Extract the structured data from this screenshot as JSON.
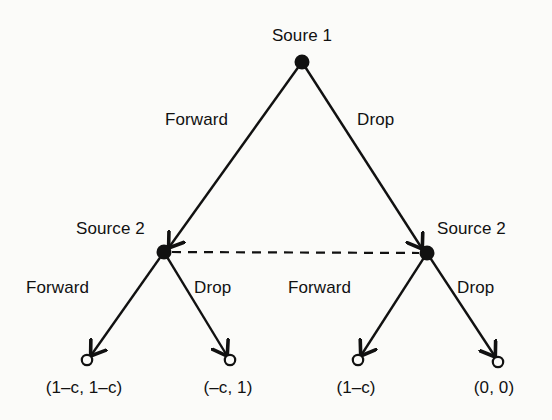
{
  "figure": {
    "type": "game-tree",
    "background_color": "#fbfbf9",
    "line_color": "#111111"
  },
  "nodes": {
    "root": {
      "label": "Soure 1",
      "marker": "filled-circle",
      "x": 302,
      "y": 62,
      "label_x": 302,
      "label_y": 26
    },
    "mid_left": {
      "label": "Source 2",
      "marker": "filled-circle",
      "x": 164,
      "y": 252,
      "label_x": 76,
      "label_y": 219
    },
    "mid_right": {
      "label": "Source 2",
      "marker": "filled-circle",
      "x": 427,
      "y": 253,
      "label_x": 437,
      "label_y": 219
    }
  },
  "information_set": {
    "style": "dashed",
    "from_x": 164,
    "from_y": 252,
    "to_x": 427,
    "to_y": 253
  },
  "branches": {
    "root_left": {
      "label": "Forward",
      "label_x": 165,
      "label_y": 110
    },
    "root_right": {
      "label": "Drop",
      "label_x": 357,
      "label_y": 110
    },
    "left_left": {
      "label": "Forward",
      "label_x": 26,
      "label_y": 278
    },
    "left_right": {
      "label": "Drop",
      "label_x": 194,
      "label_y": 278
    },
    "right_left": {
      "label": "Forward",
      "label_x": 288,
      "label_y": 278
    },
    "right_right": {
      "label": "Drop",
      "label_x": 457,
      "label_y": 278
    }
  },
  "terminals": [
    {
      "payoff": "(1–c, 1–c)",
      "marker": "open-circle",
      "x": 87,
      "y": 360,
      "label_x": 84,
      "label_y": 378
    },
    {
      "payoff": "(–c, 1)",
      "marker": "open-circle",
      "x": 230,
      "y": 360,
      "label_x": 228,
      "label_y": 378
    },
    {
      "payoff": "(1–c)",
      "marker": "open-circle",
      "x": 358,
      "y": 360,
      "label_x": 356,
      "label_y": 378
    },
    {
      "payoff": "(0, 0)",
      "marker": "open-circle",
      "x": 498,
      "y": 362,
      "label_x": 494,
      "label_y": 378
    }
  ]
}
